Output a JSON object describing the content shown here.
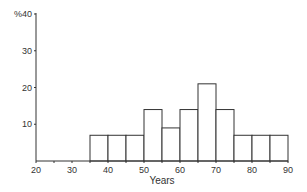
{
  "chart_data": {
    "type": "bar",
    "subtype": "histogram",
    "title": "",
    "xlabel": "Years",
    "ylabel": "%",
    "xlim": [
      20,
      90
    ],
    "ylim": [
      0,
      40
    ],
    "x_ticks": [
      20,
      30,
      40,
      50,
      60,
      70,
      80,
      90
    ],
    "y_ticks": [
      10,
      20,
      30,
      40
    ],
    "y_tick_labels": [
      "10",
      "20",
      "30",
      "%40"
    ],
    "grid": false,
    "legend": null,
    "bins": [
      {
        "start": 35,
        "end": 40,
        "value": 7
      },
      {
        "start": 40,
        "end": 45,
        "value": 7
      },
      {
        "start": 45,
        "end": 50,
        "value": 7
      },
      {
        "start": 50,
        "end": 55,
        "value": 14
      },
      {
        "start": 55,
        "end": 60,
        "value": 9
      },
      {
        "start": 60,
        "end": 65,
        "value": 14
      },
      {
        "start": 65,
        "end": 70,
        "value": 21
      },
      {
        "start": 70,
        "end": 75,
        "value": 14
      },
      {
        "start": 75,
        "end": 80,
        "value": 7
      },
      {
        "start": 80,
        "end": 85,
        "value": 7
      },
      {
        "start": 85,
        "end": 90,
        "value": 7
      }
    ],
    "categories": [
      "35-40",
      "40-45",
      "45-50",
      "50-55",
      "55-60",
      "60-65",
      "65-70",
      "70-75",
      "75-80",
      "80-85",
      "85-90"
    ],
    "values": [
      7,
      7,
      7,
      14,
      9,
      14,
      21,
      14,
      7,
      7,
      7
    ]
  },
  "colors": {
    "stroke": "#333333",
    "fill": "#ffffff"
  }
}
